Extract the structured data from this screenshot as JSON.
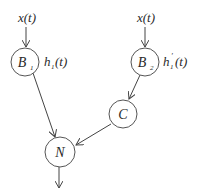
{
  "diagram": {
    "nodes": [
      {
        "id": "B1",
        "label_main": "B",
        "label_sub": "1",
        "side_label": "h",
        "side_sub": "1",
        "side_prime": "",
        "side_arg": "(t)"
      },
      {
        "id": "B2",
        "label_main": "B",
        "label_sub": "2",
        "side_label": "h",
        "side_sub": "1",
        "side_prime": "′",
        "side_arg": "(t)"
      },
      {
        "id": "C",
        "label_main": "C"
      },
      {
        "id": "N",
        "label_main": "N"
      }
    ],
    "inputs": [
      {
        "target": "B1",
        "label": "x(t)"
      },
      {
        "target": "B2",
        "label": "x(t)"
      }
    ],
    "edges": [
      {
        "from": "B1",
        "to": "N"
      },
      {
        "from": "B2",
        "to": "C"
      },
      {
        "from": "C",
        "to": "N"
      },
      {
        "from": "N",
        "to": "output"
      }
    ],
    "colors": {
      "stroke": "#555555",
      "text": "#2a2a2a",
      "background": "#ffffff"
    }
  }
}
